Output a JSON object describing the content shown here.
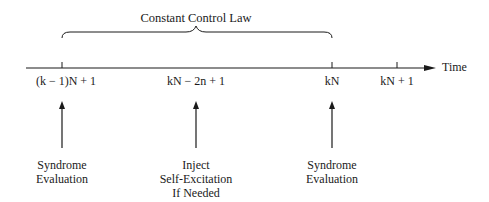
{
  "diagram": {
    "title": "Constant Control Law",
    "axis_label": "Time",
    "ticks": [
      {
        "label": "(k − 1)N + 1",
        "x": 62
      },
      {
        "label": "kN − 2n + 1",
        "x": 196,
        "tick_drawn": false
      },
      {
        "label": "kN",
        "x": 332
      },
      {
        "label": "kN + 1",
        "x": 397
      }
    ],
    "events": [
      {
        "label": "Syndrome\nEvaluation",
        "x": 62
      },
      {
        "label": "Inject\nSelf-Excitation\nIf Needed",
        "x": 196
      },
      {
        "label": "Syndrome\nEvaluation",
        "x": 332
      }
    ],
    "brace": {
      "from_x": 62,
      "to_x": 332,
      "label": "Constant Control Law"
    },
    "colors": {
      "line": "#1a1a1a",
      "background": "#ffffff"
    }
  }
}
